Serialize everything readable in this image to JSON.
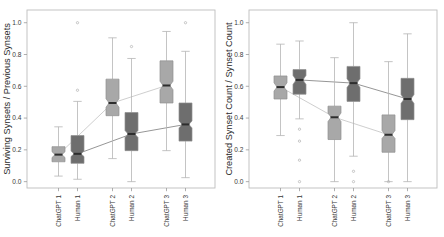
{
  "figure": {
    "background": "#ffffff",
    "panel_count": 2,
    "colors": {
      "chatgpt_box": "#a8a8a8",
      "human_box": "#6e6e6e",
      "box_border": "#8f8f8f",
      "median": "#2d2d2d",
      "whisker": "#b5b5b5",
      "outlier": "#b0b0b0",
      "frame": "#bdbdbd",
      "trend_chatgpt": "#c8c8c8",
      "trend_human": "#8a8a8a",
      "tick": "#9a9a9a"
    }
  },
  "chart_data": [
    {
      "panel": "left",
      "type": "box",
      "title": "",
      "xlabel": "",
      "ylabel": "Surviving Synsets / Previous Synsets",
      "ylim": [
        -0.04,
        1.08
      ],
      "yticks": [
        0.0,
        0.2,
        0.4,
        0.6,
        0.8,
        1.0
      ],
      "ytick_labels": [
        "0.0",
        "0.2",
        "0.4",
        "0.6",
        "0.8",
        "1.0"
      ],
      "grid": false,
      "legend": "none",
      "categories": [
        "ChatGPT 1",
        "Human 1",
        "ChatGPT 2",
        "Human 2",
        "ChatGPT 3",
        "Human 3"
      ],
      "groups": [
        "ChatGPT",
        "Human",
        "ChatGPT",
        "Human",
        "ChatGPT",
        "Human"
      ],
      "boxes": [
        {
          "label": "ChatGPT 1",
          "group": "ChatGPT",
          "whisker_low": 0.035,
          "q1": 0.125,
          "median": 0.17,
          "q3": 0.22,
          "whisker_high": 0.345,
          "notch_low": 0.152,
          "notch_high": 0.188,
          "outliers": []
        },
        {
          "label": "Human 1",
          "group": "Human",
          "whisker_low": 0.015,
          "q1": 0.115,
          "median": 0.175,
          "q3": 0.29,
          "whisker_high": 0.505,
          "notch_low": 0.158,
          "notch_high": 0.193,
          "outliers": [
            0.575,
            1.0
          ]
        },
        {
          "label": "ChatGPT 2",
          "group": "ChatGPT",
          "whisker_low": 0.145,
          "q1": 0.415,
          "median": 0.495,
          "q3": 0.645,
          "whisker_high": 0.905,
          "notch_low": 0.468,
          "notch_high": 0.522,
          "outliers": []
        },
        {
          "label": "Human 2",
          "group": "Human",
          "whisker_low": 0.0,
          "q1": 0.195,
          "median": 0.3,
          "q3": 0.435,
          "whisker_high": 0.775,
          "notch_low": 0.278,
          "notch_high": 0.322,
          "outliers": [
            0.85
          ]
        },
        {
          "label": "ChatGPT 3",
          "group": "ChatGPT",
          "whisker_low": 0.195,
          "q1": 0.495,
          "median": 0.605,
          "q3": 0.76,
          "whisker_high": 0.945,
          "notch_low": 0.578,
          "notch_high": 0.632,
          "outliers": []
        },
        {
          "label": "Human 3",
          "group": "Human",
          "whisker_low": 0.025,
          "q1": 0.255,
          "median": 0.36,
          "q3": 0.495,
          "whisker_high": 0.82,
          "notch_low": 0.338,
          "notch_high": 0.382,
          "outliers": [
            1.0
          ]
        }
      ],
      "trend_lines": [
        {
          "name": "ChatGPT",
          "series": [
            0.17,
            0.495,
            0.605
          ],
          "color": "#c8c8c8"
        },
        {
          "name": "Human",
          "series": [
            0.175,
            0.3,
            0.36
          ],
          "color": "#8a8a8a"
        }
      ]
    },
    {
      "panel": "right",
      "type": "box",
      "title": "",
      "xlabel": "",
      "ylabel": "Created Synset Count / Synset Count",
      "ylim": [
        -0.04,
        1.08
      ],
      "yticks": [
        0.0,
        0.2,
        0.4,
        0.6,
        0.8,
        1.0
      ],
      "ytick_labels": [
        "0.0",
        "0.2",
        "0.4",
        "0.6",
        "0.8",
        "1.0"
      ],
      "grid": false,
      "legend": "none",
      "categories": [
        "ChatGPT 1",
        "Human 1",
        "ChatGPT 2",
        "Human 2",
        "ChatGPT 3",
        "Human 3"
      ],
      "groups": [
        "ChatGPT",
        "Human",
        "ChatGPT",
        "Human",
        "ChatGPT",
        "Human"
      ],
      "boxes": [
        {
          "label": "ChatGPT 1",
          "group": "ChatGPT",
          "whisker_low": 0.29,
          "q1": 0.52,
          "median": 0.595,
          "q3": 0.665,
          "whisker_high": 0.865,
          "notch_low": 0.57,
          "notch_high": 0.622,
          "outliers": []
        },
        {
          "label": "Human 1",
          "group": "Human",
          "whisker_low": 0.395,
          "q1": 0.55,
          "median": 0.64,
          "q3": 0.705,
          "whisker_high": 0.885,
          "notch_low": 0.612,
          "notch_high": 0.668,
          "outliers": [
            0.33,
            0.255,
            0.135,
            0.0
          ]
        },
        {
          "label": "ChatGPT 2",
          "group": "ChatGPT",
          "whisker_low": 0.0,
          "q1": 0.265,
          "median": 0.405,
          "q3": 0.475,
          "whisker_high": 0.78,
          "notch_low": 0.378,
          "notch_high": 0.432,
          "outliers": []
        },
        {
          "label": "Human 2",
          "group": "Human",
          "whisker_low": 0.16,
          "q1": 0.505,
          "median": 0.62,
          "q3": 0.725,
          "whisker_high": 1.0,
          "notch_low": 0.592,
          "notch_high": 0.648,
          "outliers": [
            0.065,
            0.0
          ]
        },
        {
          "label": "ChatGPT 3",
          "group": "ChatGPT",
          "whisker_low": 0.0,
          "q1": 0.185,
          "median": 0.295,
          "q3": 0.42,
          "whisker_high": 0.755,
          "notch_low": 0.272,
          "notch_high": 0.322,
          "outliers": [
            0.0
          ]
        },
        {
          "label": "Human 3",
          "group": "Human",
          "whisker_low": 0.0,
          "q1": 0.39,
          "median": 0.52,
          "q3": 0.65,
          "whisker_high": 0.93,
          "notch_low": 0.492,
          "notch_high": 0.548,
          "outliers": []
        }
      ],
      "trend_lines": [
        {
          "name": "Human",
          "series": [
            0.64,
            0.62,
            0.52
          ],
          "color": "#8a8a8a"
        },
        {
          "name": "ChatGPT",
          "series": [
            0.595,
            0.405,
            0.295
          ],
          "color": "#c8c8c8"
        }
      ]
    }
  ]
}
